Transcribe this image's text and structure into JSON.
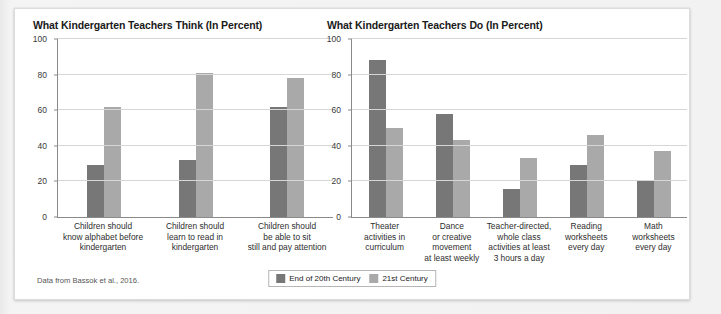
{
  "source_note": "Data from Bassok et al., 2016.",
  "legend": {
    "position": "bottom-center",
    "entries": [
      {
        "label": "End of 20th Century",
        "color": "#777777"
      },
      {
        "label": "21st Century",
        "color": "#a9a9a9"
      }
    ]
  },
  "chart_data": [
    {
      "type": "bar",
      "title": "What Kindergarten Teachers Think (In Percent)",
      "xlabel": "",
      "ylabel": "",
      "ylim": [
        0,
        100
      ],
      "yticks": [
        0,
        20,
        40,
        60,
        80,
        100
      ],
      "grid": true,
      "categories": [
        "Children should know alphabet before kindergarten",
        "Children should learn to read in kindergarten",
        "Children should be able to sit still and pay attention"
      ],
      "category_lines": [
        [
          "Children should",
          "know alphabet before",
          "kindergarten"
        ],
        [
          "Children should",
          "learn to read in",
          "kindergarten"
        ],
        [
          "Children should",
          "be able to sit",
          "still and pay attention"
        ]
      ],
      "series": [
        {
          "name": "End of 20th Century",
          "color": "#777777",
          "values": [
            29,
            32,
            62
          ]
        },
        {
          "name": "21st Century",
          "color": "#a9a9a9",
          "values": [
            62,
            81,
            78
          ]
        }
      ]
    },
    {
      "type": "bar",
      "title": "What Kindergarten Teachers Do (In Percent)",
      "xlabel": "",
      "ylabel": "",
      "ylim": [
        0,
        100
      ],
      "yticks": [
        0,
        20,
        40,
        60,
        80,
        100
      ],
      "grid": true,
      "categories": [
        "Theater activities in curriculum",
        "Dance or creative movement at least weekly",
        "Teacher-directed, whole class activities at least 3 hours a day",
        "Reading worksheets every day",
        "Math worksheets every day"
      ],
      "category_lines": [
        [
          "Theater",
          "activities in",
          "curriculum"
        ],
        [
          "Dance",
          "or creative",
          "movement",
          "at least weekly"
        ],
        [
          "Teacher-directed,",
          "whole class",
          "activities at least",
          "3 hours a day"
        ],
        [
          "Reading",
          "worksheets",
          "every day"
        ],
        [
          "Math",
          "worksheets",
          "every day"
        ]
      ],
      "series": [
        {
          "name": "End of 20th Century",
          "color": "#777777",
          "values": [
            88,
            58,
            16,
            29,
            21
          ]
        },
        {
          "name": "21st Century",
          "color": "#a9a9a9",
          "values": [
            50,
            43,
            33,
            46,
            37
          ]
        }
      ]
    }
  ]
}
